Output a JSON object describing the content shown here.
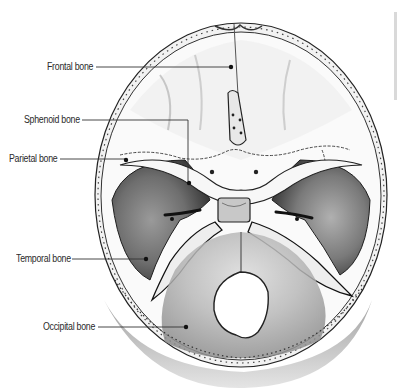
{
  "figure": {
    "labels": [
      {
        "id": "frontal",
        "text": "Frontal bone",
        "label_x": 47,
        "label_y": 61,
        "line": [
          [
            96,
            67
          ],
          [
            231,
            67
          ]
        ],
        "dot": [
          231,
          67
        ]
      },
      {
        "id": "sphenoid",
        "text": "Sphenoid bone",
        "label_x": 24,
        "label_y": 114,
        "line": [
          [
            82,
            120
          ],
          [
            188,
            120
          ],
          [
            188,
            181
          ]
        ],
        "dot": [
          189,
          183
        ]
      },
      {
        "id": "parietal",
        "text": "Parietal bone",
        "label_x": 9,
        "label_y": 152,
        "line": [
          [
            60,
            159
          ],
          [
            126,
            159
          ]
        ],
        "dot": [
          126,
          160
        ]
      },
      {
        "id": "temporal",
        "text": "Temporal bone",
        "label_x": 16,
        "label_y": 253,
        "line": [
          [
            72,
            259
          ],
          [
            146,
            259
          ]
        ],
        "dot": [
          146,
          259
        ]
      },
      {
        "id": "occipital",
        "text": "Occipital bone",
        "label_x": 43,
        "label_y": 321,
        "line": [
          [
            98,
            327
          ],
          [
            186,
            327
          ]
        ],
        "dot": [
          186,
          327
        ]
      }
    ]
  },
  "colors": {
    "background": "#ffffff",
    "label_text": "#2a2a2a",
    "leader_line": "#333333",
    "bone_light": "#f4f4f4",
    "bone_shadow": "#4a4a4a",
    "outline": "#1e1e1e"
  }
}
